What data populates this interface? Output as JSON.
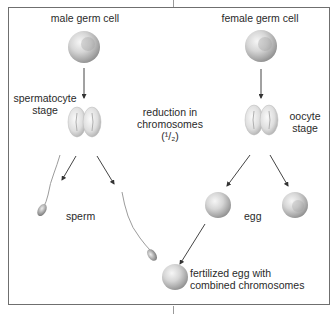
{
  "diagram": {
    "type": "meiosis-fertilization",
    "labels": {
      "male_germ_cell": "male germ cell",
      "female_germ_cell": "female germ cell",
      "spermatocyte_stage_line1": "spermatocyte",
      "spermatocyte_stage_line2": "stage",
      "oocyte_stage_line1": "oocyte",
      "oocyte_stage_line2": "stage",
      "reduction_line1": "reduction in",
      "reduction_line2": "chromosomes",
      "reduction_line3": "(¹/₂)",
      "sperm": "sperm",
      "egg": "egg",
      "fertilized_line1": "fertilized egg with",
      "fertilized_line2": "combined chromosomes"
    },
    "nodes": [
      {
        "id": "male-germ-cell",
        "shape": "sphere"
      },
      {
        "id": "spermatocyte",
        "shape": "dividing-cell"
      },
      {
        "id": "sperm-left",
        "shape": "sperm"
      },
      {
        "id": "sperm-right",
        "shape": "sperm"
      },
      {
        "id": "female-germ-cell",
        "shape": "sphere"
      },
      {
        "id": "oocyte",
        "shape": "dividing-cell"
      },
      {
        "id": "egg-left",
        "shape": "sphere"
      },
      {
        "id": "egg-right",
        "shape": "sphere"
      },
      {
        "id": "fertilized-egg",
        "shape": "sphere"
      }
    ],
    "edges": [
      {
        "from": "male-germ-cell",
        "to": "spermatocyte"
      },
      {
        "from": "spermatocyte",
        "to": "sperm-left"
      },
      {
        "from": "spermatocyte",
        "to": "sperm-right"
      },
      {
        "from": "female-germ-cell",
        "to": "oocyte"
      },
      {
        "from": "oocyte",
        "to": "egg-left"
      },
      {
        "from": "oocyte",
        "to": "egg-right"
      },
      {
        "from": "egg-left",
        "to": "fertilized-egg"
      }
    ],
    "colors": {
      "frame": "#6f6f6f",
      "arrow": "#444444",
      "cell_light": "#f4f4f4",
      "cell_dark": "#8a8a8a"
    }
  }
}
